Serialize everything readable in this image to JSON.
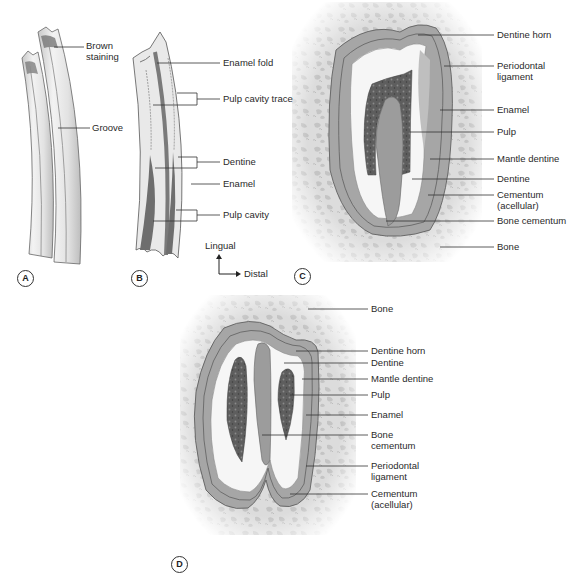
{
  "figure": {
    "panels": [
      {
        "id": "A",
        "labels": [
          "Brown staining",
          "Groove"
        ]
      },
      {
        "id": "B",
        "labels": [
          "Enamel fold",
          "Pulp cavity trace",
          "Dentine",
          "Enamel",
          "Pulp cavity"
        ],
        "orientation": {
          "up": "Lingual",
          "right": "Distal"
        }
      },
      {
        "id": "C",
        "labels": [
          "Dentine horn",
          "Periodontal ligament",
          "Enamel",
          "Pulp",
          "Mantle dentine",
          "Dentine",
          "Cementum (acellular)",
          "Bone cementum",
          "Bone"
        ]
      },
      {
        "id": "D",
        "labels": [
          "Bone",
          "Dentine horn",
          "Dentine",
          "Mantle dentine",
          "Pulp",
          "Enamel",
          "Bone cementum",
          "Periodontal ligament",
          "Cementum (acellular)"
        ]
      }
    ],
    "colors": {
      "enamel": "#a9a9a9",
      "dentine": "#f4f4f4",
      "pulp": "#5c5c5c",
      "bone": "#d9d9d9",
      "outline": "#555555",
      "cementum": "#9a9a9a",
      "stain": "#6b6b6b"
    }
  },
  "A": {
    "letter": "A",
    "brown": "Brown\nstaining",
    "groove": "Groove"
  },
  "B": {
    "letter": "B",
    "enamel_fold": "Enamel fold",
    "pulp_trace": "Pulp cavity trace",
    "dentine": "Dentine",
    "enamel": "Enamel",
    "pulp_cavity": "Pulp cavity",
    "lingual": "Lingual",
    "distal": "Distal"
  },
  "C": {
    "letter": "C",
    "dentine_horn": "Dentine horn",
    "pdl": "Periodontal\nligament",
    "enamel": "Enamel",
    "pulp": "Pulp",
    "mantle": "Mantle dentine",
    "dentine": "Dentine",
    "cementum": "Cementum\n(acellular)",
    "bone_cementum": "Bone cementum",
    "bone": "Bone"
  },
  "D": {
    "letter": "D",
    "bone": "Bone",
    "dentine_horn": "Dentine horn",
    "dentine": "Dentine",
    "mantle": "Mantle dentine",
    "pulp": "Pulp",
    "enamel": "Enamel",
    "bone_cementum": "Bone\ncementum",
    "pdl": "Periodontal\nligament",
    "cementum": "Cementum\n(acellular)"
  }
}
